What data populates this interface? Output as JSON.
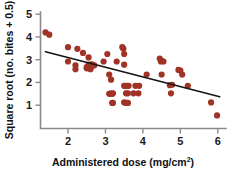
{
  "chart_data": {
    "type": "scatter",
    "title": "",
    "xlabel": "Administered dose (mg/cm2)",
    "xlabel_main": "Administered dose (mg/cm",
    "xlabel_sup": "2",
    "xlabel_close": ")",
    "ylabel": "Square root (no. bites + 0.5)",
    "xlim": [
      1.25,
      6.2
    ],
    "ylim": [
      0.35,
      5.15
    ],
    "xticks": [
      2,
      3,
      4,
      5,
      6
    ],
    "xticklabels": [
      "2",
      "3",
      "4",
      "5",
      "6"
    ],
    "yticks": [
      1,
      2,
      3,
      4,
      5
    ],
    "yticklabels": [
      "1",
      "2",
      "3",
      "4",
      "5"
    ],
    "grid": false,
    "legend": null,
    "point_color": "#a03226",
    "line_color": "#141414",
    "axis_color": "#8a8a8a",
    "marker": "circle",
    "marker_size": 3.1,
    "series": [
      {
        "name": "observations",
        "x": [
          1.4,
          1.5,
          2.0,
          2.0,
          2.2,
          2.2,
          2.25,
          2.4,
          2.5,
          2.5,
          2.55,
          2.55,
          2.58,
          2.6,
          2.6,
          2.62,
          2.65,
          2.7,
          2.95,
          3.05,
          3.1,
          3.1,
          3.15,
          3.15,
          3.18,
          3.18,
          3.2,
          3.2,
          3.3,
          3.45,
          3.48,
          3.5,
          3.5,
          3.5,
          3.5,
          3.52,
          3.55,
          3.55,
          3.58,
          3.6,
          3.6,
          3.62,
          3.75,
          3.8,
          3.88,
          3.9,
          4.1,
          4.45,
          4.48,
          4.5,
          4.5,
          4.55,
          4.72,
          4.75,
          4.78,
          4.95,
          5.0,
          5.05,
          5.2,
          5.82,
          5.98
        ],
        "y": [
          4.2,
          4.1,
          3.55,
          2.92,
          2.75,
          2.58,
          3.48,
          3.3,
          2.68,
          2.62,
          3.1,
          2.78,
          2.75,
          2.62,
          2.58,
          2.8,
          2.78,
          2.75,
          2.92,
          3.25,
          2.35,
          1.5,
          2.12,
          1.52,
          1.5,
          1.1,
          1.52,
          1.1,
          2.92,
          3.55,
          3.48,
          3.25,
          2.78,
          1.85,
          1.12,
          1.85,
          1.52,
          1.1,
          1.85,
          1.52,
          1.1,
          1.85,
          1.52,
          1.85,
          1.52,
          1.85,
          2.35,
          3.05,
          2.92,
          2.95,
          2.35,
          2.92,
          1.88,
          1.52,
          1.9,
          2.55,
          2.52,
          2.35,
          1.85,
          1.12,
          0.55
        ]
      }
    ],
    "trendline": {
      "name": "linear fit",
      "x0": 1.4,
      "y0": 3.35,
      "x1": 6.05,
      "y1": 1.37
    }
  }
}
